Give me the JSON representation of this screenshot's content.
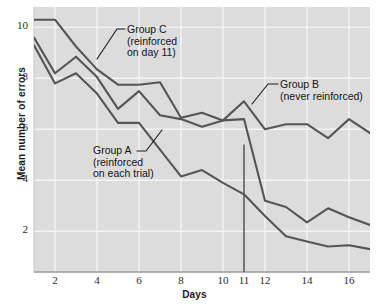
{
  "figure": {
    "background": "#ffffff",
    "plot_background": "#dcdcdc",
    "grid_color": "#f4f4f4",
    "line_color": "#555555"
  },
  "axes": {
    "x_title": "Days",
    "y_title": "Mean number of errors",
    "x_ticks": [
      2,
      4,
      6,
      8,
      10,
      11,
      12,
      14,
      16
    ],
    "y_ticks": [
      2,
      4,
      6,
      8,
      10
    ]
  },
  "annotations": [
    {
      "name": "group-c-label",
      "lines": [
        "Group C",
        "(reinforced",
        "on day 11)"
      ],
      "x": 127,
      "y": 24
    },
    {
      "name": "group-b-label",
      "lines": [
        "Group B",
        "(never reinforced)"
      ],
      "x": 280,
      "y": 79
    },
    {
      "name": "group-a-label",
      "lines": [
        "Group A",
        "(reinforced",
        "on each trial)"
      ],
      "x": 93,
      "y": 145
    }
  ],
  "chart_data": {
    "type": "line",
    "title": "",
    "xlabel": "Days",
    "ylabel": "Mean number of errors",
    "xlim": [
      1,
      17
    ],
    "ylim": [
      0.4,
      10.8
    ],
    "grid": true,
    "legend": "inline-annotations",
    "x": [
      1,
      2,
      3,
      4,
      5,
      6,
      7,
      8,
      9,
      10,
      11,
      12,
      13,
      14,
      15,
      16,
      17
    ],
    "series": [
      {
        "name": "Group A (reinforced on each trial)",
        "values": [
          9.3,
          7.8,
          8.2,
          7.4,
          6.25,
          6.25,
          5.2,
          4.15,
          4.4,
          3.9,
          3.45,
          2.6,
          1.8,
          1.6,
          1.4,
          1.45,
          1.3
        ]
      },
      {
        "name": "Group B (never reinforced)",
        "values": [
          9.6,
          8.2,
          8.85,
          8.05,
          6.8,
          7.5,
          6.55,
          6.4,
          6.1,
          6.35,
          7.1,
          6.0,
          6.2,
          6.2,
          5.65,
          6.4,
          5.85
        ]
      },
      {
        "name": "Group C (reinforced on day 11)",
        "values": [
          10.3,
          10.3,
          9.25,
          8.35,
          7.75,
          7.75,
          7.85,
          6.45,
          6.65,
          6.35,
          6.4,
          3.2,
          2.95,
          2.35,
          2.9,
          2.55,
          2.25
        ]
      }
    ],
    "markers": [
      {
        "name": "day-11-reinforcement-line",
        "type": "vline",
        "x": 11,
        "y_top": 5.4,
        "y_bottom": 0.4
      }
    ]
  }
}
